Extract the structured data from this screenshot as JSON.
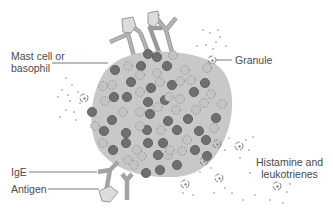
{
  "diagram": {
    "labels": {
      "mast_cell_line1": "Mast cell or",
      "mast_cell_line2": "basophil",
      "granule": "Granule",
      "ige": "IgE",
      "antigen": "Antigen",
      "histamine_line1": "Histamine and",
      "histamine_line2": "leukotrienes"
    },
    "colors": {
      "cell_fill": "#c8c8c8",
      "dark_granule": "#6f6f6f",
      "light_granule": "#bdbdbd",
      "antibody": "#a9a9a9",
      "antigen": "#d9d9d9",
      "text": "#4a4a4a",
      "leader_line": "#555555"
    }
  }
}
